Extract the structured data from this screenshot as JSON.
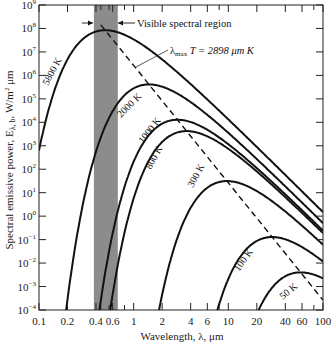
{
  "chart_data": {
    "type": "line",
    "title": "",
    "xlabel": "Wavelength, λ, μm",
    "ylabel": "Spectral emissive power, Eλ, b, W/m² μm",
    "xscale": "log",
    "yscale": "log",
    "xlim": [
      0.1,
      100
    ],
    "ylim": [
      0.0001,
      1000000000
    ],
    "grid": false,
    "x_tick_labels": [
      "0.1",
      "0.2",
      "0.4",
      "0.6",
      "1",
      "2",
      "4",
      "6",
      "10",
      "20",
      "40",
      "60",
      "100"
    ],
    "x_tick_values": [
      0.1,
      0.2,
      0.4,
      0.6,
      1,
      2,
      4,
      6,
      10,
      20,
      40,
      60,
      100
    ],
    "x_minor_ticks": [
      0.45,
      0.55,
      0.8,
      8,
      80
    ],
    "y_tick_exponents": [
      9,
      8,
      7,
      6,
      5,
      4,
      3,
      2,
      1,
      0,
      -1,
      -2,
      -3,
      -4
    ],
    "series": [
      {
        "name": "5800 K",
        "temperature_K": 5800,
        "peak_wavelength_um": 0.5,
        "peak_value": 63000000.0
      },
      {
        "name": "2000 K",
        "temperature_K": 2000,
        "peak_wavelength_um": 1.45,
        "peak_value": 370000.0
      },
      {
        "name": "1000 K",
        "temperature_K": 1000,
        "peak_wavelength_um": 2.9,
        "peak_value": 11000.0
      },
      {
        "name": "800 K",
        "temperature_K": 800,
        "peak_wavelength_um": 3.6,
        "peak_value": 3600.0
      },
      {
        "name": "300 K",
        "temperature_K": 300,
        "peak_wavelength_um": 9.66,
        "peak_value": 31
      },
      {
        "name": "100 K",
        "temperature_K": 100,
        "peak_wavelength_um": 29,
        "peak_value": 0.13
      },
      {
        "name": "50 K",
        "temperature_K": 50,
        "peak_wavelength_um": 58,
        "peak_value": 0.004
      }
    ],
    "annotations": [
      {
        "text": "Visible spectral region",
        "range_um": [
          0.38,
          0.68
        ],
        "shading": "#8a8a8a"
      },
      {
        "text": "λmax T = 2898 μm K",
        "type": "dashed-locus-line"
      }
    ]
  },
  "labels": {
    "xlabel": "Wavelength, λ, μm",
    "ylabel_main": "Spectral emissive power, E",
    "ylabel_sub": "λ, b",
    "ylabel_units": ", W/m",
    "ylabel_sup": "2",
    "ylabel_tail": " μm",
    "visible_region": "Visible spectral region",
    "wien_prefix": "λ",
    "wien_sub": "max",
    "wien_rest": " T = 2898 μm K"
  },
  "colors": {
    "curve": "#111111",
    "visible_band": "#8c8c8c",
    "axis": "#222222"
  }
}
